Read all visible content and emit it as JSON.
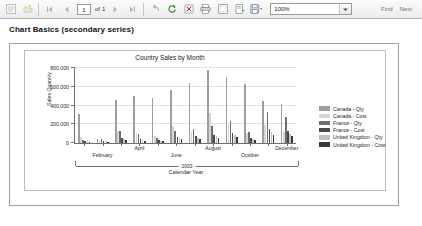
{
  "toolbar": {
    "buttons": [
      {
        "name": "document-map-icon",
        "glyph": "map"
      },
      {
        "name": "back-to-parent-icon",
        "glyph": "parent"
      },
      {
        "name": "first-page-icon",
        "glyph": "first"
      },
      {
        "name": "previous-page-icon",
        "glyph": "prev"
      },
      {
        "name": "next-page-icon",
        "glyph": "next"
      },
      {
        "name": "last-page-icon",
        "glyph": "last"
      },
      {
        "name": "back-icon",
        "glyph": "back"
      },
      {
        "name": "refresh-icon",
        "glyph": "refresh"
      },
      {
        "name": "stop-icon",
        "glyph": "stop"
      },
      {
        "name": "print-icon",
        "glyph": "print"
      },
      {
        "name": "print-layout-icon",
        "glyph": "layout"
      },
      {
        "name": "page-setup-icon",
        "glyph": "setup"
      },
      {
        "name": "export-icon",
        "glyph": "export"
      }
    ],
    "current_page": "1",
    "of_label": "of",
    "page_count": "1",
    "zoom_value": "100%",
    "find_label": "Find",
    "next_label": "Next"
  },
  "report": {
    "title": "Chart Basics (secondary series)"
  },
  "chart_data": {
    "type": "bar",
    "title": "Country Sales by Month",
    "xlabel": "Calendar Year",
    "ylabel": "Sales Quantity",
    "ylim": [
      0,
      800000
    ],
    "yticks": [
      "0",
      "200.000",
      "400.000",
      "600.000",
      "800.000"
    ],
    "ytick_values": [
      0,
      200000,
      400000,
      600000,
      800000
    ],
    "grid": true,
    "legend_position": "right",
    "group_label": "2003",
    "categories": [
      "January",
      "February",
      "March",
      "April",
      "May",
      "June",
      "July",
      "August",
      "September",
      "October",
      "November",
      "December"
    ],
    "visible_tick_labels": [
      "February",
      "April",
      "June",
      "August",
      "October",
      "December"
    ],
    "series": [
      {
        "name": "Canada - Qty",
        "color": "#9e9e9e",
        "values": [
          310000,
          40000,
          455000,
          500000,
          480000,
          565000,
          640000,
          780000,
          700000,
          630000,
          450000,
          415000
        ]
      },
      {
        "name": "Canada - Cost",
        "color": "#d6d6d6",
        "values": [
          60000,
          35000,
          130000,
          105000,
          70000,
          185000,
          120000,
          320000,
          200000,
          105000,
          195000,
          115000
        ]
      },
      {
        "name": "France - Qty",
        "color": "#6e6e6e",
        "values": [
          30000,
          45000,
          125000,
          100000,
          55000,
          130000,
          145000,
          180000,
          235000,
          120000,
          330000,
          275000
        ]
      },
      {
        "name": "France - Cost",
        "color": "#4a4a4a",
        "values": [
          25000,
          20000,
          55000,
          45000,
          30000,
          60000,
          70000,
          90000,
          110000,
          55000,
          150000,
          130000
        ]
      },
      {
        "name": "United Kingdom - Qty",
        "color": "#c2c2c2",
        "values": [
          20000,
          18000,
          40000,
          35000,
          25000,
          50000,
          55000,
          70000,
          85000,
          45000,
          120000,
          100000
        ]
      },
      {
        "name": "United Kingdom - Cost",
        "color": "#3a3a3a",
        "values": [
          15000,
          12000,
          30000,
          26000,
          18000,
          38000,
          42000,
          55000,
          65000,
          34000,
          90000,
          78000
        ]
      }
    ]
  }
}
